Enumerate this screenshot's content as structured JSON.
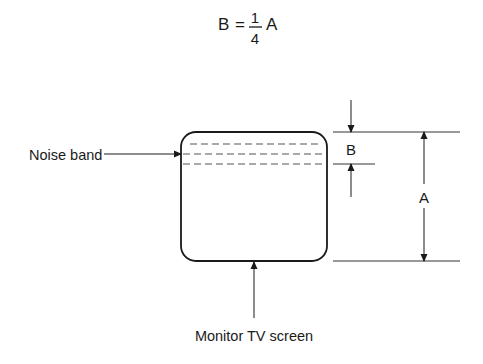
{
  "formula": {
    "lhs": "B",
    "equals": "=",
    "numerator": "1",
    "denominator": "4",
    "rhs": "A"
  },
  "labels": {
    "noise_band": "Noise band",
    "monitor": "Monitor TV screen",
    "dim_b": "B",
    "dim_a": "A"
  },
  "colors": {
    "line": "#1a1a1a",
    "dashed": "#555555",
    "background": "#ffffff"
  }
}
